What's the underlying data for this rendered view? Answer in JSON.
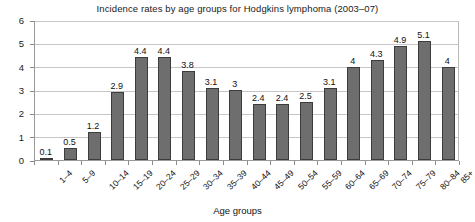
{
  "chart_data": {
    "type": "bar",
    "title": "Incidence rates by age groups for Hodgkins lymphoma (2003–07)",
    "xlabel": "Age groups",
    "ylabel": "",
    "ylim": [
      0,
      6
    ],
    "yticks": [
      "0",
      "1",
      "2",
      "3",
      "4",
      "5",
      "6"
    ],
    "grid": true,
    "legend": null,
    "bar_color": "#6e6e6e",
    "bar_border_color": "#3c3c3c",
    "categories": [
      "1–4",
      "5–9",
      "10–14",
      "15–19",
      "20–24",
      "25–29",
      "30–34",
      "35–39",
      "40–44",
      "45–49",
      "50–54",
      "55–59",
      "60–64",
      "65–69",
      "70–74",
      "75–79",
      "80–84",
      "85+"
    ],
    "values": [
      0.1,
      0.5,
      1.2,
      2.9,
      4.4,
      4.4,
      3.8,
      3.1,
      3,
      2.4,
      2.4,
      2.5,
      3.1,
      4,
      4.3,
      4.9,
      5.1,
      4
    ],
    "value_labels": [
      "0.1",
      "0.5",
      "1.2",
      "2.9",
      "4.4",
      "4.4",
      "3.8",
      "3.1",
      "3",
      "2.4",
      "2.4",
      "2.5",
      "3.1",
      "4",
      "4.3",
      "4.9",
      "5.1",
      "4"
    ]
  }
}
